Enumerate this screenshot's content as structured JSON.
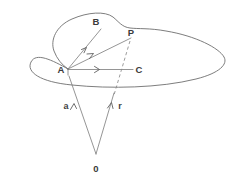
{
  "figure": {
    "background_color": "#ffffff",
    "stroke_color": "#6e6e6e",
    "label_color": "#3a3a3a",
    "width": 232,
    "height": 188
  },
  "labels": {
    "point_b": "B",
    "point_p": "P",
    "point_a": "A",
    "point_c": "C",
    "vector_a": "a",
    "vector_r": "r",
    "origin": "0"
  },
  "geometry": {
    "point_a": {
      "x": 68,
      "y": 69
    },
    "point_b": {
      "x": 101,
      "y": 29
    },
    "point_p": {
      "x": 131,
      "y": 38
    },
    "point_c": {
      "x": 133,
      "y": 70
    },
    "origin": {
      "x": 96,
      "y": 155
    },
    "surface_outline": "M 68 69 C 40 44 52 23 92 16 C 104 13 110 18 116 22 C 122 26 131 29 150 29 C 190 29 222 44 224 55 C 226 66 196 82 150 86 C 104 90 80 85 68 69 Z",
    "vectors_from_a": [
      {
        "name": "A-to-B",
        "to_x": 101,
        "to_y": 29,
        "style": "solid",
        "arrow_mid": true
      },
      {
        "name": "A-to-P",
        "to_x": 131,
        "to_y": 38,
        "style": "solid",
        "arrow_mid": true
      },
      {
        "name": "A-to-C",
        "to_x": 133,
        "to_y": 70,
        "style": "solid",
        "arrow_mid": true
      }
    ],
    "dashed_segment": {
      "from_x": 131,
      "from_y": 40,
      "to_x": 114,
      "to_y": 95
    },
    "origin_vectors": [
      {
        "name": "0-to-A",
        "label": "a",
        "from_x": 96,
        "from_y": 155,
        "to_x": 68,
        "to_y": 74,
        "label_x": 66,
        "label_y": 107
      },
      {
        "name": "0-to-P",
        "label": "r",
        "from_x": 96,
        "from_y": 155,
        "to_x": 114,
        "to_y": 92,
        "label_x": 119,
        "label_y": 107
      }
    ]
  }
}
